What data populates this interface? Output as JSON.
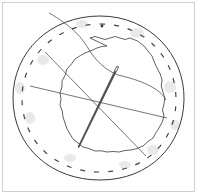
{
  "illustration": {
    "subject": "fabric circle with basting stitches, needle and thread",
    "colors": {
      "line": "#3a3a3a",
      "stitch": "#444444",
      "shade": "#e6e6e6",
      "frame": "#cfcfcf",
      "background": "#ffffff"
    }
  }
}
